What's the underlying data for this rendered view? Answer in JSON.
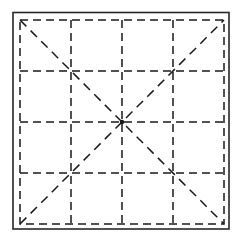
{
  "figure": {
    "title": "Dashed grid square with diagonals",
    "canvas": {
      "width": 243,
      "height": 243,
      "background_color": "#ffffff"
    },
    "colors": {
      "stroke": "#1a1a1a",
      "border_stroke": "#262626",
      "background": "#ffffff"
    },
    "outer_border": {
      "name": "solid-square-border",
      "style": "solid",
      "stroke_width": 1.6,
      "x": 13,
      "y": 12.5,
      "width": 216,
      "height": 216.5
    },
    "inner_square": {
      "name": "dashed-square-outline",
      "style": "dashed",
      "stroke_width": 1.5,
      "dash_pattern": "8 5",
      "x": 20,
      "y": 20,
      "width": 204,
      "height": 204
    },
    "grid": {
      "name": "dashed-grid",
      "rows": 4,
      "columns": 4,
      "style": "dashed",
      "stroke_width": 1.5,
      "dash_pattern": "8 5",
      "vertical_line_x": [
        71,
        122,
        173
      ],
      "horizontal_line_y": [
        71,
        122,
        173
      ],
      "cell_size": 51
    },
    "diagonals": [
      {
        "name": "diagonal-top-left-to-bottom-right",
        "style": "dashed",
        "stroke_width": 1.5,
        "dash_pattern": "9 6",
        "x1": 20,
        "y1": 20,
        "x2": 224,
        "y2": 224
      },
      {
        "name": "diagonal-bottom-left-to-top-right",
        "style": "dashed",
        "stroke_width": 1.5,
        "dash_pattern": "9 6",
        "x1": 20,
        "y1": 224,
        "x2": 224,
        "y2": 20
      }
    ],
    "center_point": {
      "name": "center-intersection",
      "x": 122,
      "y": 122,
      "radius": 2.2
    }
  }
}
